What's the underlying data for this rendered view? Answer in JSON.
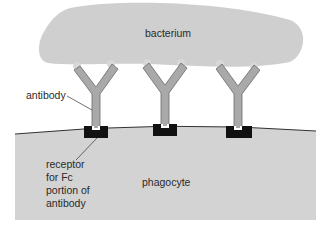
{
  "diagram": {
    "colors": {
      "background": "#ffffff",
      "bacterium_fill": "#cfcfcf",
      "phagocyte_fill": "#d3d3d3",
      "antibody_fill": "#a9a9a9",
      "antibody_outline": "#6a6a6a",
      "receptor_fill": "#111111",
      "membrane_line": "#333333",
      "text": "#2a2a2a"
    },
    "labels": {
      "bacterium": "bacterium",
      "antibody": "antibody",
      "receptor_line1": "receptor",
      "receptor_line2": "for Fc",
      "receptor_line3": "portion of",
      "receptor_line4": "antibody",
      "phagocyte": "phagocyte"
    },
    "antibodies": [
      {
        "name": "antibody-1",
        "x": 95
      },
      {
        "name": "antibody-2",
        "x": 165
      },
      {
        "name": "antibody-3",
        "x": 238
      }
    ]
  }
}
